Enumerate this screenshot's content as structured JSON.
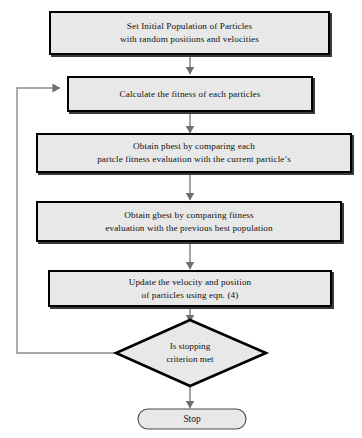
{
  "diagram": {
    "type": "flowchart",
    "colors": {
      "node_fill": "#e8e8e8",
      "node_border": "#000000",
      "connector": "#808080",
      "feedback_line": "#808080",
      "background": "#ffffff",
      "text": "#111111"
    },
    "nodes": [
      {
        "id": "set-initial-population",
        "shape": "process",
        "text": "Set Initial Population of Particles\nwith random positions and velocities"
      },
      {
        "id": "calculate-fitness",
        "shape": "process",
        "text": "Calculate the fitness of each  particles"
      },
      {
        "id": "obtain-pbest",
        "shape": "process",
        "text": "Obtain pbest by comparing each\npartcle fitness evaluation with the  current particle’s"
      },
      {
        "id": "obtain-gbest",
        "shape": "process",
        "text": "Obtain gbest by comparing fitness\nevaluation with the previous best  population"
      },
      {
        "id": "update-velocity-position",
        "shape": "process",
        "text": "Update the velocity and position\nof particles using eqn. (4)"
      },
      {
        "id": "stopping-criterion",
        "shape": "decision",
        "text": "Is stopping\ncriterion met"
      },
      {
        "id": "stop",
        "shape": "terminal",
        "text": "Stop"
      }
    ],
    "edges": [
      {
        "id": "e1",
        "from": "set-initial-population",
        "to": "calculate-fitness",
        "label": ""
      },
      {
        "id": "e2",
        "from": "calculate-fitness",
        "to": "obtain-pbest",
        "label": ""
      },
      {
        "id": "e3",
        "from": "obtain-pbest",
        "to": "obtain-gbest",
        "label": ""
      },
      {
        "id": "e4",
        "from": "obtain-gbest",
        "to": "update-velocity-position",
        "label": ""
      },
      {
        "id": "e5",
        "from": "update-velocity-position",
        "to": "stopping-criterion",
        "label": ""
      },
      {
        "id": "e6",
        "from": "stopping-criterion",
        "to": "stop",
        "label": ""
      },
      {
        "id": "e7",
        "from": "stopping-criterion",
        "to": "calculate-fitness",
        "label": ""
      }
    ]
  }
}
